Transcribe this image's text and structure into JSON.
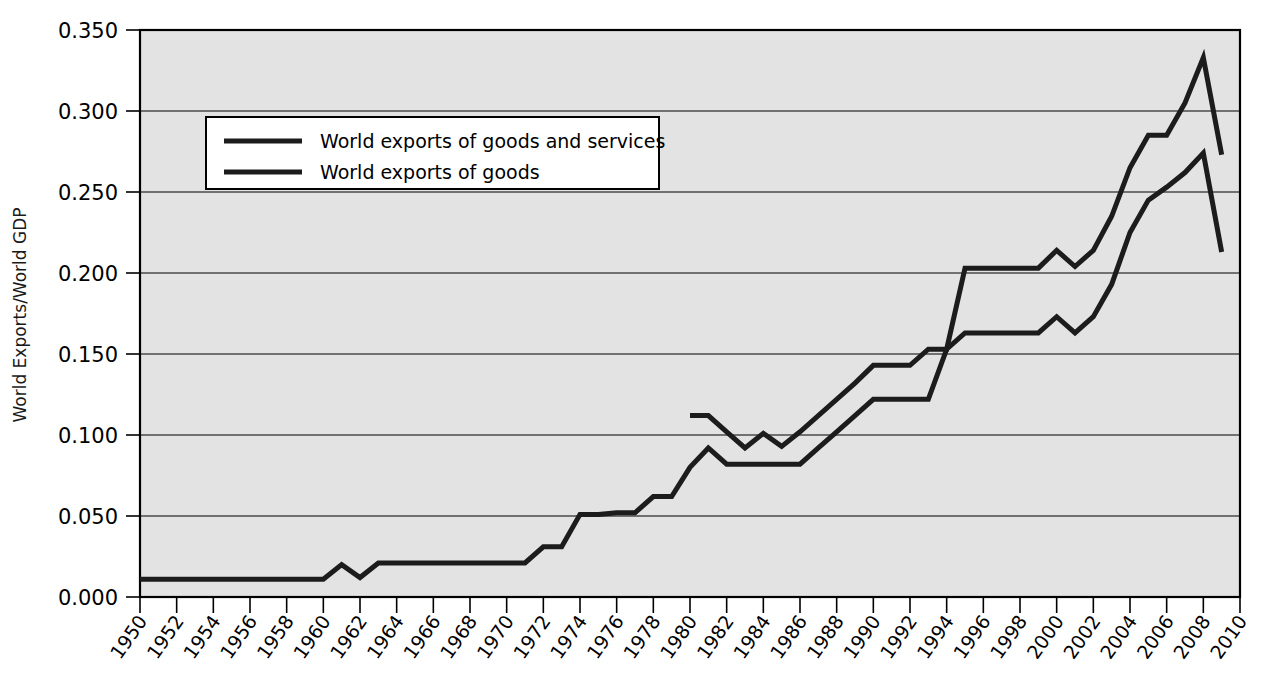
{
  "chart_data": {
    "type": "line",
    "title": "",
    "xlabel": "",
    "ylabel": "World Exports/World GDP",
    "xlim": [
      1950,
      2010
    ],
    "ylim": [
      0.0,
      0.35
    ],
    "grid": true,
    "legend_position": "upper-left-inside",
    "y_ticks": [
      "0.000",
      "0.050",
      "0.100",
      "0.150",
      "0.200",
      "0.250",
      "0.300",
      "0.350"
    ],
    "y_tick_values": [
      0.0,
      0.05,
      0.1,
      0.15,
      0.2,
      0.25,
      0.3,
      0.35
    ],
    "x_ticks": [
      "1950",
      "1952",
      "1954",
      "1956",
      "1958",
      "1960",
      "1962",
      "1964",
      "1966",
      "1968",
      "1970",
      "1972",
      "1974",
      "1976",
      "1978",
      "1980",
      "1982",
      "1984",
      "1986",
      "1988",
      "1990",
      "1992",
      "1994",
      "1996",
      "1998",
      "2000",
      "2002",
      "2004",
      "2006",
      "2008",
      "2010"
    ],
    "x_tick_values": [
      1950,
      1952,
      1954,
      1956,
      1958,
      1960,
      1962,
      1964,
      1966,
      1968,
      1970,
      1972,
      1974,
      1976,
      1978,
      1980,
      1982,
      1984,
      1986,
      1988,
      1990,
      1992,
      1994,
      1996,
      1998,
      2000,
      2002,
      2004,
      2006,
      2008,
      2010
    ],
    "series": [
      {
        "name": "World exports of goods and services",
        "color": "#1c1c1c",
        "x": [
          1980,
          1981,
          1982,
          1983,
          1984,
          1985,
          1986,
          1987,
          1988,
          1989,
          1990,
          1991,
          1992,
          1993,
          1994,
          1995,
          1996,
          1997,
          1998,
          1999,
          2000,
          2001,
          2002,
          2003,
          2004,
          2005,
          2006,
          2007,
          2008,
          2009
        ],
        "values": [
          0.112,
          0.112,
          0.102,
          0.092,
          0.101,
          0.093,
          0.102,
          0.112,
          0.122,
          0.132,
          0.143,
          0.143,
          0.143,
          0.153,
          0.153,
          0.203,
          0.203,
          0.203,
          0.203,
          0.203,
          0.214,
          0.204,
          0.214,
          0.235,
          0.265,
          0.285,
          0.285,
          0.305,
          0.333,
          0.273
        ]
      },
      {
        "name": "World exports of goods",
        "color": "#1c1c1c",
        "x": [
          1950,
          1951,
          1952,
          1953,
          1954,
          1955,
          1956,
          1957,
          1958,
          1959,
          1960,
          1961,
          1962,
          1963,
          1964,
          1965,
          1966,
          1967,
          1968,
          1969,
          1970,
          1971,
          1972,
          1973,
          1974,
          1975,
          1976,
          1977,
          1978,
          1979,
          1980,
          1981,
          1982,
          1983,
          1984,
          1985,
          1986,
          1987,
          1988,
          1989,
          1990,
          1991,
          1992,
          1993,
          1994,
          1995,
          1996,
          1997,
          1998,
          1999,
          2000,
          2001,
          2002,
          2003,
          2004,
          2005,
          2006,
          2007,
          2008,
          2009
        ],
        "values": [
          0.011,
          0.011,
          0.011,
          0.011,
          0.011,
          0.011,
          0.011,
          0.011,
          0.011,
          0.011,
          0.011,
          0.02,
          0.012,
          0.021,
          0.021,
          0.021,
          0.021,
          0.021,
          0.021,
          0.021,
          0.021,
          0.021,
          0.031,
          0.031,
          0.051,
          0.051,
          0.052,
          0.052,
          0.062,
          0.062,
          0.08,
          0.092,
          0.082,
          0.082,
          0.082,
          0.082,
          0.082,
          0.092,
          0.102,
          0.112,
          0.122,
          0.122,
          0.122,
          0.122,
          0.153,
          0.163,
          0.163,
          0.163,
          0.163,
          0.163,
          0.173,
          0.163,
          0.173,
          0.193,
          0.225,
          0.245,
          0.253,
          0.262,
          0.274,
          0.213
        ]
      }
    ]
  },
  "legend": {
    "entries": [
      {
        "label": "World exports of goods and services"
      },
      {
        "label": "World exports of goods"
      }
    ]
  }
}
